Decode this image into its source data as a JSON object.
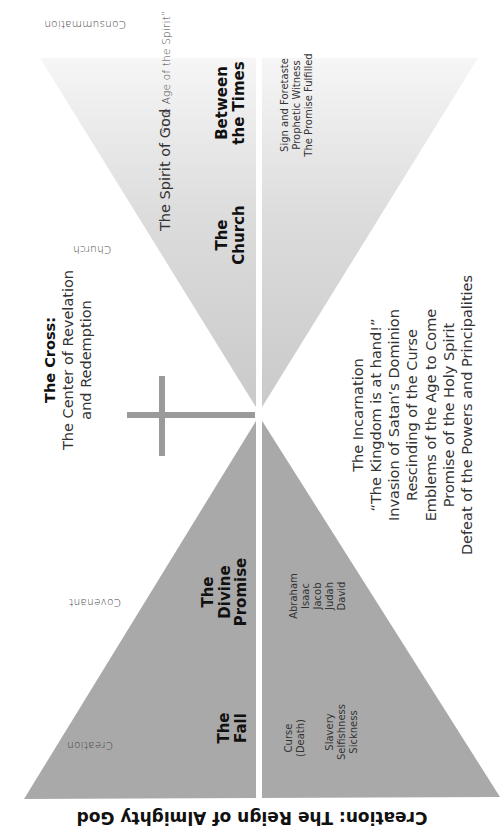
{
  "title": "Creation: The Reign of Almighty God",
  "era_labels": {
    "creation": "Creation",
    "covenant": "Covenant",
    "church": "Church",
    "consummation": "Consummation"
  },
  "phases": {
    "fall": [
      "The",
      "Fall"
    ],
    "divine_promise": [
      "The",
      "Divine",
      "Promise"
    ],
    "church": [
      "The",
      "Church"
    ],
    "between_times": [
      "Between",
      "the Times"
    ]
  },
  "fall_effects": {
    "curse": [
      "Curse",
      "(Death)"
    ],
    "consequences": [
      "Slavery",
      "Selfishness",
      "Sickness"
    ]
  },
  "patriarchs": [
    "Abraham",
    "Isaac",
    "Jacob",
    "Judah",
    "David"
  ],
  "church_marks": [
    "Sign and Foretaste",
    "Prophetic Witness",
    "The Promise Fulfilled"
  ],
  "spirit_labels": {
    "spirit_of_god": "The Spirit of God",
    "age_of_spirit": "“The Age of the Spirit”"
  },
  "cross": {
    "heading": "The Cross:",
    "lines": [
      "The Center of Revelation",
      "and Redemption"
    ]
  },
  "incarnation": [
    "The Incarnation",
    "“The Kingdom is at hand!”",
    "Invasion of Satan’s Dominion",
    "Rescinding of the Curse",
    "Emblems of the Age to Come",
    "Promise of the Holy Spirit",
    "Defeat of the Powers and Principalities"
  ],
  "colors": {
    "lower_triangle": "#a9a9a9",
    "upper_triangle_near": "#cfcfcf",
    "upper_triangle_far": "#f2f2f2",
    "cross": "#9a9a9a",
    "divider": "#ffffff"
  }
}
